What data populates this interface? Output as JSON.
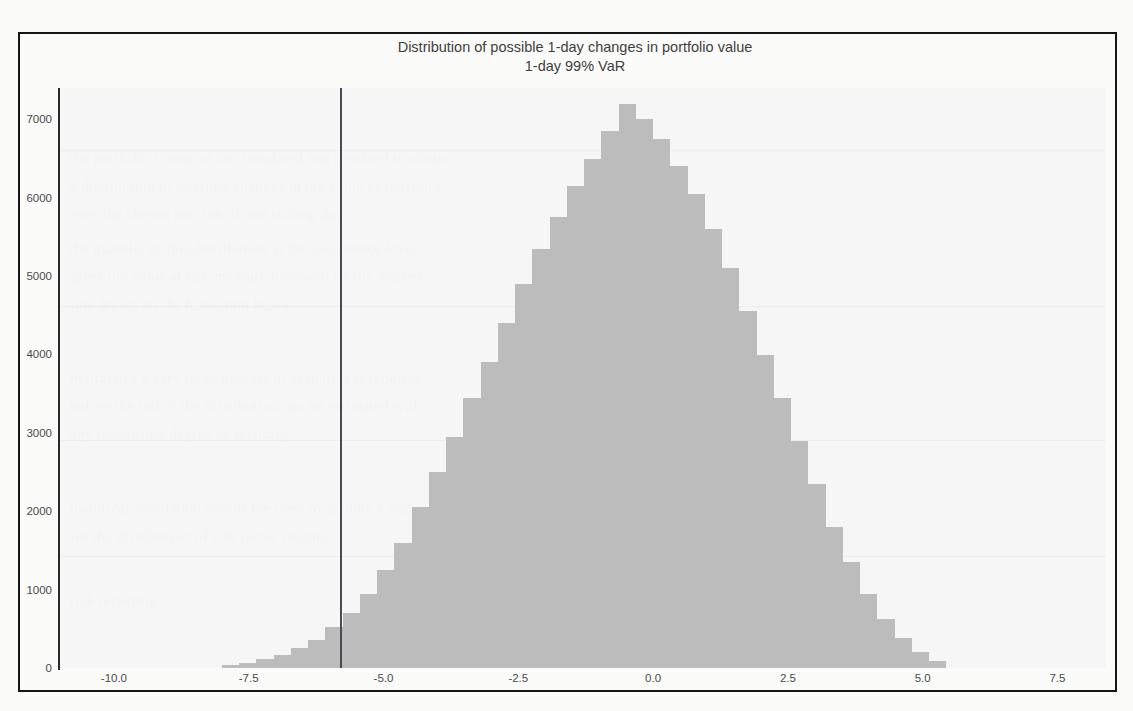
{
  "figure": {
    "title": "Distribution of possible 1-day changes in portfolio value",
    "subtitle": "1-day 99% VaR",
    "frame_color": "#161616",
    "bar_color": "#bcbcbc",
    "var_line_color": "#4a4a52",
    "plot_bg": "#f3f3f4"
  },
  "chart_data": {
    "type": "bar",
    "title": "Distribution of possible 1-day changes in portfolio value",
    "subtitle": "1-day 99% VaR",
    "xlabel": "",
    "ylabel": "",
    "xlim": [
      -11.0,
      8.4
    ],
    "ylim": [
      0,
      7400
    ],
    "grid": false,
    "legend": null,
    "xticks": [
      "-10.0",
      "-7.5",
      "-5.0",
      "-2.5",
      "0.0",
      "2.5",
      "5.0",
      "7.5"
    ],
    "xtick_values": [
      -10.0,
      -7.5,
      -5.0,
      -2.5,
      0.0,
      2.5,
      5.0,
      7.5
    ],
    "yticks": [
      "0",
      "1000",
      "2000",
      "3000",
      "4000",
      "5000",
      "6000",
      "7000"
    ],
    "ytick_values": [
      0,
      1000,
      2000,
      3000,
      4000,
      5000,
      6000,
      7000
    ],
    "annotations": [
      {
        "name": "var-line",
        "type": "vline",
        "x": -5.8,
        "label": "1-day 99% VaR"
      }
    ],
    "bin_width": 0.32,
    "bin_centers": [
      -7.84,
      -7.52,
      -7.2,
      -6.88,
      -6.56,
      -6.24,
      -5.92,
      -5.6,
      -5.28,
      -4.96,
      -4.64,
      -4.32,
      -4.0,
      -3.68,
      -3.36,
      -3.04,
      -2.72,
      -2.4,
      -2.08,
      -1.76,
      -1.44,
      -1.12,
      -0.8,
      -0.48,
      -0.16,
      0.16,
      0.48,
      0.8,
      1.12,
      1.44,
      1.76,
      2.08,
      2.4,
      2.72,
      3.04,
      3.36,
      3.68,
      4.0,
      4.32,
      4.64,
      4.96,
      5.28
    ],
    "values": [
      40,
      70,
      110,
      170,
      250,
      360,
      520,
      700,
      950,
      1250,
      1600,
      2050,
      2500,
      2950,
      3450,
      3900,
      4400,
      4900,
      5350,
      5750,
      6150,
      6500,
      6850,
      7200,
      7000,
      6750,
      6400,
      6050,
      5600,
      5100,
      4550,
      4000,
      3450,
      2900,
      2350,
      1800,
      1350,
      950,
      620,
      380,
      200,
      90
    ]
  }
}
